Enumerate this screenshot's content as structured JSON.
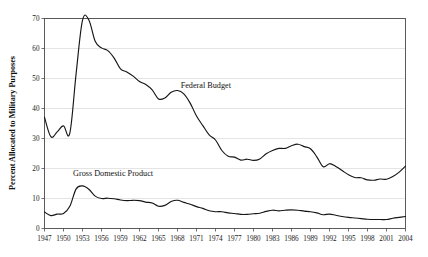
{
  "chart_data": {
    "type": "line",
    "title": "",
    "xlabel": "",
    "ylabel": "Percent Allocated to Military Purposes",
    "xlim": [
      1947,
      2004
    ],
    "ylim": [
      0,
      70
    ],
    "grid": true,
    "legend_position": "inline-annotation",
    "y_ticks": [
      0,
      10,
      20,
      30,
      40,
      50,
      60,
      70
    ],
    "y_tick_labels": [
      "0",
      "10",
      "20",
      "30",
      "40",
      "50",
      "60",
      "70"
    ],
    "x_ticks": [
      1947,
      1950,
      1953,
      1956,
      1959,
      1962,
      1965,
      1968,
      1971,
      1974,
      1977,
      1980,
      1983,
      1986,
      1989,
      1992,
      1995,
      1998,
      2001,
      2004
    ],
    "x_tick_labels": [
      "1947",
      "1950",
      "1953",
      "1956",
      "1959",
      "1962",
      "1965",
      "1968",
      "1971",
      "1974",
      "1977",
      "1980",
      "1983",
      "1986",
      "1989",
      "1992",
      "1995",
      "1998",
      "2001",
      "2004"
    ],
    "x": [
      1947,
      1948,
      1949,
      1950,
      1951,
      1952,
      1953,
      1954,
      1955,
      1956,
      1957,
      1958,
      1959,
      1960,
      1961,
      1962,
      1963,
      1964,
      1965,
      1966,
      1967,
      1968,
      1969,
      1970,
      1971,
      1972,
      1973,
      1974,
      1975,
      1976,
      1977,
      1978,
      1979,
      1980,
      1981,
      1982,
      1983,
      1984,
      1985,
      1986,
      1987,
      1988,
      1989,
      1990,
      1991,
      1992,
      1993,
      1994,
      1995,
      1996,
      1997,
      1998,
      1999,
      2000,
      2001,
      2002,
      2003,
      2004
    ],
    "series": [
      {
        "name": "Federal Budget",
        "label_text": "Federal Budget",
        "color": "#161616",
        "values": [
          37.1,
          30.6,
          32.2,
          34.2,
          31.8,
          51.8,
          69.4,
          69.5,
          62.4,
          60.2,
          59.3,
          56.8,
          53.2,
          52.2,
          50.8,
          49.0,
          48.0,
          46.2,
          43.2,
          43.5,
          45.4,
          46.0,
          44.9,
          41.8,
          37.5,
          34.3,
          31.2,
          29.5,
          26.0,
          24.1,
          23.8,
          22.8,
          23.1,
          22.7,
          23.2,
          24.9,
          26.0,
          26.7,
          26.7,
          27.6,
          28.1,
          27.3,
          26.6,
          23.9,
          20.6,
          21.6,
          20.7,
          19.3,
          17.9,
          17.0,
          16.9,
          16.2,
          16.1,
          16.5,
          16.4,
          17.3,
          18.8,
          20.8
        ]
      },
      {
        "name": "Gross Domestic Product",
        "label_text": "Gross Domestic Product",
        "color": "#161616",
        "values": [
          5.5,
          4.3,
          4.8,
          5.0,
          7.4,
          13.2,
          14.2,
          13.1,
          10.8,
          10.0,
          10.1,
          9.9,
          9.5,
          9.3,
          9.4,
          9.3,
          8.8,
          8.5,
          7.4,
          7.7,
          9.0,
          9.4,
          8.7,
          8.1,
          7.3,
          6.7,
          5.9,
          5.6,
          5.6,
          5.2,
          5.0,
          4.7,
          4.7,
          4.9,
          5.1,
          5.7,
          6.1,
          5.9,
          6.1,
          6.2,
          6.1,
          5.8,
          5.6,
          5.2,
          4.6,
          4.8,
          4.4,
          4.0,
          3.7,
          3.5,
          3.3,
          3.1,
          3.0,
          3.0,
          3.0,
          3.4,
          3.7,
          4.0
        ]
      }
    ],
    "annotations": [
      {
        "text": "Federal Budget",
        "x": 1968.5,
        "y": 47.0
      },
      {
        "text": "Gross Domestic Product",
        "x": 1951.5,
        "y": 17.5
      }
    ]
  }
}
